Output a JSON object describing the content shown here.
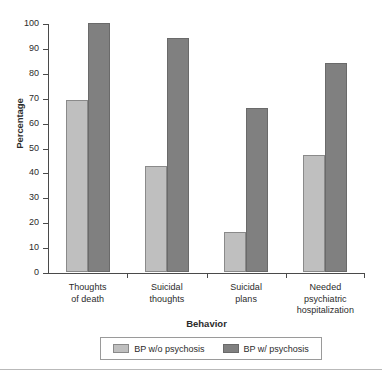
{
  "chart_data": {
    "type": "bar",
    "title": "",
    "xlabel": "Behavior",
    "ylabel": "Percentage",
    "ylim": [
      0,
      100
    ],
    "ytick_step": 10,
    "yticks": [
      100,
      90,
      80,
      70,
      60,
      50,
      40,
      30,
      20,
      10,
      0
    ],
    "grid": false,
    "legend_position": "bottom",
    "categories": [
      "Thoughts of death",
      "Suicidal thoughts",
      "Suicidal plans",
      "Needed psychiatric hospitalization"
    ],
    "category_label_lines": [
      [
        "Thoughts",
        "of death"
      ],
      [
        "Suicidal",
        "thoughts"
      ],
      [
        "Suicidal",
        "plans"
      ],
      [
        "Needed",
        "psychiatric",
        "hospitalization"
      ]
    ],
    "series": [
      {
        "name": "BP w/o psychosis",
        "color": "#bfbfbf",
        "values": [
          69,
          42.5,
          16,
          47
        ]
      },
      {
        "name": "BP w/ psychosis",
        "color": "#808080",
        "values": [
          100,
          94,
          66,
          84
        ]
      }
    ]
  },
  "axis": {
    "y_title": "Percentage",
    "x_title": "Behavior"
  },
  "legend": {
    "items": [
      {
        "label": "BP w/o psychosis",
        "series": "a"
      },
      {
        "label": "BP w/ psychosis",
        "series": "b"
      }
    ]
  }
}
